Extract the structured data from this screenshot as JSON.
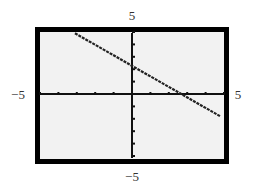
{
  "chart_data": {
    "type": "line",
    "title": "",
    "xlabel": "",
    "ylabel": "",
    "xlim": [
      -5,
      5
    ],
    "ylim": [
      -5,
      5
    ],
    "x_tick_spacing": 1,
    "y_tick_spacing": 1,
    "grid": false,
    "legend": null,
    "window_labels": {
      "xmin": "−5",
      "xmax": "5",
      "ymin": "−5",
      "ymax": "5"
    },
    "series": [
      {
        "name": "line",
        "style": "dotted-pixel",
        "x": [
          -3.1,
          4.8
        ],
        "y": [
          4.9,
          -1.8
        ],
        "slope_approx": -0.85,
        "y_intercept_approx": 2.35,
        "x_intercept_approx": 2.8
      }
    ]
  },
  "colors": {
    "frame": "#000000",
    "screen": "#f2f2f2",
    "axis": "#111111",
    "line": "#222222",
    "label": "#333333"
  }
}
